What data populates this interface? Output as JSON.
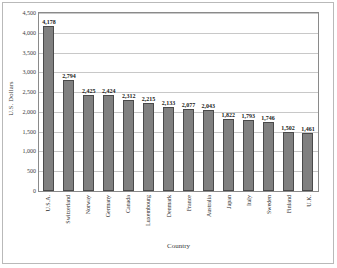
{
  "chart_data": {
    "type": "bar",
    "title": "",
    "xlabel": "Country",
    "ylabel": "U.S. Dollars",
    "ylim": [
      0,
      4500
    ],
    "ytick_step": 500,
    "grid": true,
    "legend": "none",
    "bar_color": "#808080",
    "bar_edge_color": "#4a4a4a",
    "categories": [
      "U.S.A.",
      "Switzerland",
      "Norway",
      "Germany",
      "Canada",
      "Luxembourg",
      "Denmark",
      "France",
      "Australia",
      "Japan",
      "Italy",
      "Sweden",
      "Finland",
      "U.K."
    ],
    "values": [
      4178,
      2794,
      2425,
      2424,
      2312,
      2215,
      2133,
      2077,
      2043,
      1822,
      1793,
      1746,
      1502,
      1461
    ],
    "value_labels": [
      "4,178",
      "2,794",
      "2,425",
      "2,424",
      "2,312",
      "2,215",
      "2,133",
      "2,077",
      "2,043",
      "1,822",
      "1,793",
      "1,746",
      "1,502",
      "1,461"
    ],
    "ytick_labels": [
      "0",
      "500",
      "1,000",
      "1,500",
      "2,000",
      "2,500",
      "3,000",
      "3,500",
      "4,000",
      "4,500"
    ],
    "ytick_values": [
      0,
      500,
      1000,
      1500,
      2000,
      2500,
      3000,
      3500,
      4000,
      4500
    ]
  }
}
